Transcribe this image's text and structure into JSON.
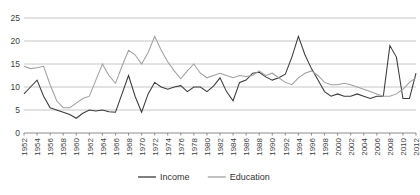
{
  "chart_data": {
    "type": "line",
    "title": "",
    "xlabel": "",
    "ylabel": "",
    "grid": true,
    "legend_position": "bottom-center",
    "ylim": [
      0,
      25
    ],
    "yticks": [
      0,
      5,
      10,
      15,
      20,
      25
    ],
    "xlim": [
      1952,
      2012
    ],
    "x": [
      1952,
      1953,
      1954,
      1955,
      1956,
      1957,
      1958,
      1959,
      1960,
      1961,
      1962,
      1963,
      1964,
      1965,
      1966,
      1967,
      1968,
      1969,
      1970,
      1971,
      1972,
      1973,
      1974,
      1975,
      1976,
      1977,
      1978,
      1979,
      1980,
      1981,
      1982,
      1983,
      1984,
      1985,
      1986,
      1987,
      1988,
      1989,
      1990,
      1991,
      1992,
      1993,
      1994,
      1995,
      1996,
      1997,
      1998,
      1999,
      2000,
      2001,
      2002,
      2003,
      2004,
      2005,
      2006,
      2007,
      2008,
      2009,
      2010,
      2011,
      2012
    ],
    "xtick_labels": [
      "1952",
      "1954",
      "1956",
      "1958",
      "1960",
      "1962",
      "1964",
      "1966",
      "1968",
      "1970",
      "1972",
      "1974",
      "1976",
      "1978",
      "1980",
      "1982",
      "1984",
      "1986",
      "1988",
      "1990",
      "1992",
      "1994",
      "1996",
      "1998",
      "2000",
      "2002",
      "2004",
      "2006",
      "2008",
      "2010",
      "2012"
    ],
    "xtick_step": 2,
    "series": [
      {
        "name": "Income",
        "color": "#3a3a3a",
        "values": [
          8.5,
          10.0,
          11.5,
          8.0,
          5.5,
          5.0,
          4.5,
          4.0,
          3.2,
          4.3,
          5.0,
          4.8,
          5.0,
          4.6,
          4.5,
          8.5,
          12.5,
          8.0,
          4.5,
          8.5,
          11.0,
          10.0,
          9.5,
          10.0,
          10.3,
          9.0,
          10.0,
          10.0,
          9.0,
          10.2,
          12.0,
          9.0,
          7.0,
          11.0,
          11.5,
          13.0,
          13.2,
          12.2,
          11.5,
          12.0,
          12.8,
          16.5,
          21.0,
          17.0,
          14.0,
          11.5,
          9.0,
          8.0,
          8.5,
          8.0,
          8.0,
          8.5,
          8.0,
          7.5,
          8.0,
          8.0,
          19.0,
          16.5,
          7.5,
          7.5,
          13.0
        ]
      },
      {
        "name": "Education",
        "color": "#a0a0a0",
        "values": [
          14.5,
          14.0,
          14.2,
          14.5,
          10.5,
          7.0,
          5.5,
          5.5,
          6.5,
          7.5,
          8.0,
          11.5,
          15.0,
          12.5,
          10.8,
          14.5,
          18.0,
          17.0,
          15.0,
          17.5,
          21.0,
          18.0,
          15.5,
          13.5,
          11.8,
          13.5,
          15.0,
          13.0,
          12.0,
          12.5,
          13.0,
          12.5,
          12.0,
          12.5,
          12.3,
          12.5,
          13.5,
          12.5,
          13.0,
          12.0,
          11.0,
          10.5,
          12.0,
          13.0,
          13.5,
          12.5,
          11.0,
          10.5,
          10.5,
          10.8,
          10.5,
          10.0,
          9.5,
          9.0,
          8.5,
          8.0,
          8.0,
          8.5,
          9.5,
          11.0,
          12.0
        ]
      }
    ],
    "legend": [
      {
        "label": "Income",
        "color": "#3a3a3a"
      },
      {
        "label": "Education",
        "color": "#a0a0a0"
      }
    ]
  }
}
